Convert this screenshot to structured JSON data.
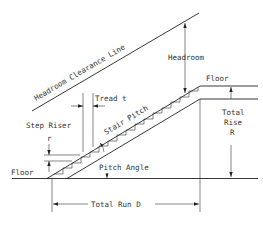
{
  "diagram": {
    "labels": {
      "headroom_clearance_line": "Headroom Clearance Line",
      "headroom": "Headroom",
      "floor_upper": "Floor",
      "floor_lower": "Floor",
      "tread": "Tread t",
      "step_riser": "Step Riser",
      "step_riser_symbol": "r",
      "stair_pitch": "Stair Pitch",
      "pitch_angle": "Pitch Angle",
      "total_rise_line1": "Total",
      "total_rise_line2": "Rise",
      "total_rise_symbol": "R",
      "total_run": "Total Run D"
    },
    "colors": {
      "line": "#222222",
      "text": "#333333",
      "background": "#ffffff"
    }
  }
}
